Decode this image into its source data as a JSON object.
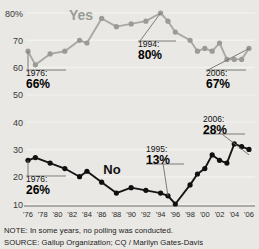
{
  "chart_data": {
    "type": "line",
    "title": "",
    "xlabel": "",
    "ylabel": "",
    "ylim": [
      10,
      80
    ],
    "xlim": [
      1976,
      2006
    ],
    "grid": true,
    "legend_position": "inline-labels",
    "y_ticks": [
      "80%",
      "70",
      "60",
      "50",
      "40",
      "30",
      "20",
      "10"
    ],
    "y_tick_values": [
      80,
      70,
      60,
      50,
      40,
      30,
      20,
      10
    ],
    "x_ticks": [
      "'76",
      "'78",
      "'80",
      "'82",
      "'84",
      "'86",
      "'88",
      "'90",
      "'92",
      "'94",
      "'96",
      "'98",
      "'00",
      "'02",
      "'04",
      "'06"
    ],
    "x_tick_values": [
      1976,
      1978,
      1980,
      1982,
      1984,
      1986,
      1988,
      1990,
      1992,
      1994,
      1996,
      1998,
      2000,
      2002,
      2004,
      2006
    ],
    "series": [
      {
        "name": "Yes",
        "color": "#a9a8a3",
        "marker_color": "#9b9a95",
        "x": [
          1976,
          1977,
          1979,
          1981,
          1983,
          1984,
          1986,
          1988,
          1990,
          1992,
          1994,
          1995,
          1996,
          1998,
          1999,
          2000,
          2001,
          2002,
          2003,
          2004,
          2005,
          2006
        ],
        "values": [
          66,
          61,
          65,
          66,
          70,
          69,
          78,
          75,
          76,
          77,
          80,
          77,
          73,
          70,
          66,
          67,
          66,
          69,
          63,
          63,
          63,
          67
        ]
      },
      {
        "name": "No",
        "color": "#151515",
        "marker_color": "#101010",
        "x": [
          1976,
          1977,
          1979,
          1981,
          1983,
          1984,
          1986,
          1988,
          1990,
          1992,
          1994,
          1995,
          1996,
          1998,
          1999,
          2000,
          2001,
          2002,
          2003,
          2004,
          2005,
          2006
        ],
        "values": [
          26,
          27,
          25,
          23,
          20,
          22,
          18,
          14,
          16,
          15,
          14,
          13,
          10,
          17,
          21,
          23,
          28,
          26,
          25,
          32,
          31,
          30
        ]
      }
    ],
    "annotations": [
      {
        "id": "yes-1976",
        "series": "Yes",
        "year_label": "1976:",
        "value_label": "66%",
        "x": 1976,
        "y": 66
      },
      {
        "id": "yes-1994",
        "series": "Yes",
        "year_label": "1994:",
        "value_label": "80%",
        "x": 1994,
        "y": 80
      },
      {
        "id": "yes-2006",
        "series": "Yes",
        "year_label": "2006:",
        "value_label": "67%",
        "x": 2006,
        "y": 67
      },
      {
        "id": "no-1976",
        "series": "No",
        "year_label": "1976:",
        "value_label": "26%",
        "x": 1976,
        "y": 26
      },
      {
        "id": "no-1995",
        "series": "No",
        "year_label": "1995:",
        "value_label": "13%",
        "x": 1995,
        "y": 13
      },
      {
        "id": "no-2006",
        "series": "No",
        "year_label": "2006:",
        "value_label": "28%",
        "x": 2006,
        "y": 28
      }
    ]
  },
  "labels": {
    "yes": "Yes",
    "no": "No"
  },
  "footer": {
    "note": "NOTE: In some years, no polling was conducted.",
    "source": "SOURCE: Gallup Organization; CQ / Marilyn Gates-Davis"
  },
  "colors": {
    "background": "#e9e8e4",
    "yes_line": "#a9a8a3",
    "no_line": "#151515",
    "gridline": "#f2f1ee",
    "axis": "#6f6e6a",
    "text": "#1a1a1a"
  }
}
